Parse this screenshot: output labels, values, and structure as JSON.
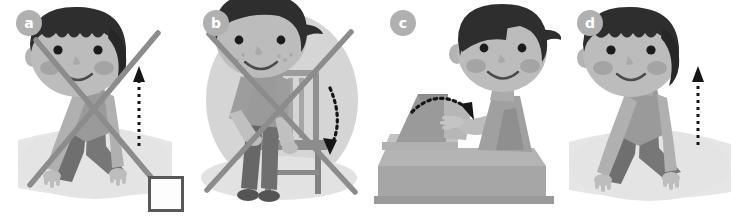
{
  "worksheet": {
    "title": "Picture exercise: choose the correct action",
    "background_color": "#ffffff",
    "panel_count": 4,
    "palette": {
      "skin": "#b9b9b9",
      "skin_shadow": "#a3a3a3",
      "hair": "#2e2e2e",
      "cheek": "#9c9c9c",
      "shirt": "#9a9a9a",
      "trousers": "#6f6f6f",
      "shadow": "#e2e2e2",
      "circle_bg": "#d5d5d5",
      "cross": "#8c8c8c",
      "arrow": "#1a1a1a",
      "badge_bg": "#b0b0b0",
      "box_border": "#585858",
      "furniture": "#9e9e9e",
      "furniture_dark": "#7d7d7d"
    },
    "panels": [
      {
        "id": "a",
        "label": "a",
        "scene": "boy-kneeling-lifting",
        "arrow": {
          "kind": "straight-dashed-up",
          "direction": "up"
        },
        "crossed_out": true,
        "answer": "",
        "has_circle_bg": false
      },
      {
        "id": "b",
        "label": "b",
        "scene": "boy-carrying-chair",
        "arrow": {
          "kind": "curved-dashed",
          "direction": "down"
        },
        "crossed_out": true,
        "answer": "",
        "has_circle_bg": true
      },
      {
        "id": "c",
        "label": "c",
        "scene": "boy-closing-box-lid-at-desk",
        "arrow": {
          "kind": "curved-dashed",
          "direction": "down-right"
        },
        "crossed_out": false,
        "answer": "",
        "has_circle_bg": false
      },
      {
        "id": "d",
        "label": "d",
        "scene": "boy-kneeling-lifting",
        "arrow": {
          "kind": "straight-dashed-up",
          "direction": "up"
        },
        "crossed_out": false,
        "answer": "1",
        "has_circle_bg": false
      }
    ]
  }
}
